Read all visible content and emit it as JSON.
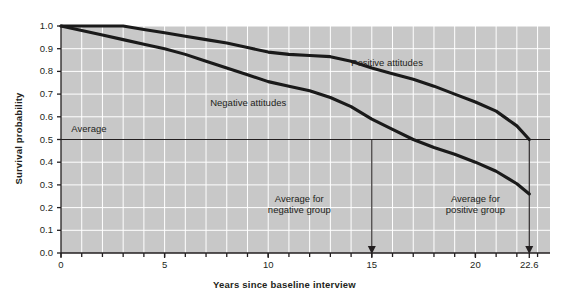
{
  "chart_data": {
    "type": "line",
    "title": "",
    "xlabel": "Years since baseline interview",
    "ylabel": "Survival probability",
    "xlim": [
      0,
      23.6
    ],
    "ylim": [
      0.0,
      1.0
    ],
    "grid": true,
    "legend": "inline-annotations",
    "plot_background": "#c8c8c8",
    "line_color": "#1a1a1a",
    "gridline_color": "#ffffff",
    "y_ticks": [
      "1.0",
      "0.9",
      "0.8",
      "0.7",
      "0.6",
      "0.5",
      "0.4",
      "0.3",
      "0.2",
      "0.1",
      "0.0"
    ],
    "y_tick_values": [
      1.0,
      0.9,
      0.8,
      0.7,
      0.6,
      0.5,
      0.4,
      0.3,
      0.2,
      0.1,
      0.0
    ],
    "x_ticks": [
      "0",
      "5",
      "10",
      "15",
      "20",
      "22.6"
    ],
    "x_tick_values": [
      0,
      5,
      10,
      15,
      20,
      22.6
    ],
    "series": [
      {
        "name": "Positive attitudes",
        "x": [
          0,
          1,
          2,
          3,
          4,
          5,
          6,
          7,
          8,
          9,
          10,
          11,
          12,
          13,
          14,
          15,
          16,
          17,
          18,
          19,
          20,
          21,
          22,
          22.6
        ],
        "values": [
          1.0,
          1.0,
          1.0,
          1.0,
          0.985,
          0.97,
          0.955,
          0.94,
          0.925,
          0.905,
          0.885,
          0.875,
          0.87,
          0.865,
          0.845,
          0.815,
          0.79,
          0.765,
          0.735,
          0.7,
          0.665,
          0.625,
          0.56,
          0.5
        ]
      },
      {
        "name": "Negative attitudes",
        "x": [
          0,
          1,
          2,
          3,
          4,
          5,
          6,
          7,
          8,
          9,
          10,
          11,
          12,
          13,
          14,
          15,
          16,
          17,
          18,
          19,
          20,
          21,
          22,
          22.6
        ],
        "values": [
          1.0,
          0.98,
          0.96,
          0.94,
          0.92,
          0.9,
          0.875,
          0.845,
          0.815,
          0.785,
          0.755,
          0.735,
          0.715,
          0.685,
          0.645,
          0.59,
          0.545,
          0.5,
          0.465,
          0.435,
          0.4,
          0.36,
          0.305,
          0.26
        ]
      }
    ],
    "reference_lines": [
      {
        "name": "Average",
        "orientation": "horizontal",
        "value": 0.5,
        "label": "Average"
      }
    ],
    "annotations": [
      {
        "name": "positive-attitudes-label",
        "text": "Positive attitudes",
        "x": 14.0,
        "y": 0.835
      },
      {
        "name": "negative-attitudes-label",
        "text": "Negative attitudes",
        "x": 7.2,
        "y": 0.66
      },
      {
        "name": "average-label",
        "text": "Average",
        "x": 0.5,
        "y": 0.545
      },
      {
        "name": "average-negative-group-note",
        "line1": "Average for",
        "line2": "negative group",
        "x": 11.5,
        "y": 0.24
      },
      {
        "name": "average-positive-group-note",
        "line1": "Average for",
        "line2": "positive group",
        "x": 20.0,
        "y": 0.24
      }
    ],
    "drop_arrows": [
      {
        "name": "negative-group-drop-arrow",
        "x": 15,
        "from_y": 0.5,
        "to_y": 0.0
      },
      {
        "name": "positive-group-drop-arrow",
        "x": 22.6,
        "from_y": 0.5,
        "to_y": 0.0
      }
    ]
  }
}
